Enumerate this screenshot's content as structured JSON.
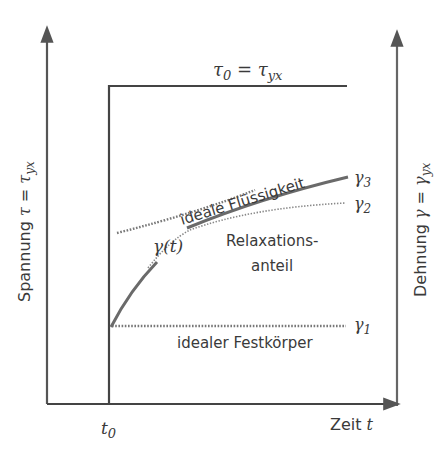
{
  "diagram": {
    "title_label": "τ₀ = τyx",
    "title_parts": {
      "tau": "τ",
      "sub0": "0",
      "eq": " = ",
      "tau2": "τ",
      "sub_yx": "yx"
    },
    "left_axis_label": {
      "text": "Spannung ",
      "sym": "τ",
      "eq": " = ",
      "sym2": "τ",
      "sub": "yx"
    },
    "right_axis_label": {
      "text": "Dehnung ",
      "sym": "γ",
      "eq": " = ",
      "sym2": "γ",
      "sub": "yx"
    },
    "x_axis_label": {
      "text": "Zeit ",
      "sym": "t"
    },
    "x_tick_label": {
      "sym": "t",
      "sub": "0"
    },
    "curve_label": "γ(t)",
    "annotations": {
      "fluid": "ideale Flüssigkeit",
      "relax_line1": "Relaxations-",
      "relax_line2": "anteil",
      "solid": "idealer Festkörper"
    },
    "levels": [
      {
        "sym": "γ",
        "sub": "3"
      },
      {
        "sym": "γ",
        "sub": "2"
      },
      {
        "sym": "γ",
        "sub": "1"
      }
    ],
    "colors": {
      "axis": "#555555",
      "stress": "#444444",
      "strain_curve": "#6e6e6e",
      "dotted": "#7a7a7a",
      "text": "#3a3a3a"
    }
  }
}
